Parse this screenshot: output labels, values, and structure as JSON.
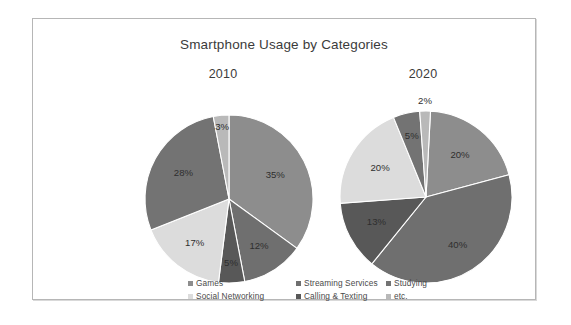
{
  "chart_data": {
    "type": "pie",
    "title": "Smartphone Usage by Categories",
    "legend_position": "bottom",
    "categories": [
      "Games",
      "Streaming Services",
      "Studying",
      "Social Networking",
      "Calling & Texting",
      "etc."
    ],
    "colors": [
      "#8d8d8d",
      "#6f6f6f",
      "#737373",
      "#dcdcdc",
      "#585858",
      "#b9b9b9"
    ],
    "panels": [
      {
        "label": "2010",
        "slices": [
          {
            "category": "Games",
            "value": 35,
            "label": "35%",
            "color": "#8d8d8d"
          },
          {
            "category": "Streaming Services",
            "value": 12,
            "label": "12%",
            "color": "#6f6f6f"
          },
          {
            "category": "Calling & Texting",
            "value": 5,
            "label": "5%",
            "color": "#585858"
          },
          {
            "category": "Social Networking",
            "value": 17,
            "label": "17%",
            "color": "#dcdcdc"
          },
          {
            "category": "Studying",
            "value": 28,
            "label": "28%",
            "color": "#737373"
          },
          {
            "category": "etc.",
            "value": 3,
            "label": "3%",
            "color": "#b9b9b9"
          }
        ]
      },
      {
        "label": "2020",
        "slices": [
          {
            "category": "Games",
            "value": 20,
            "label": "20%",
            "color": "#8d8d8d"
          },
          {
            "category": "Streaming Services",
            "value": 40,
            "label": "40%",
            "color": "#6f6f6f"
          },
          {
            "category": "Calling & Texting",
            "value": 13,
            "label": "13%",
            "color": "#585858"
          },
          {
            "category": "Social Networking",
            "value": 20,
            "label": "20%",
            "color": "#dcdcdc"
          },
          {
            "category": "Studying",
            "value": 5,
            "label": "5%",
            "color": "#737373"
          },
          {
            "category": "etc.",
            "value": 2,
            "label": "2%",
            "color": "#b9b9b9"
          }
        ]
      }
    ]
  },
  "legend": {
    "rows": [
      [
        {
          "label": "Games",
          "color": "#8d8d8d"
        },
        {
          "label": "Streaming Services",
          "color": "#6f6f6f"
        },
        {
          "label": "Studying",
          "color": "#737373"
        }
      ],
      [
        {
          "label": "Social Networking",
          "color": "#dcdcdc"
        },
        {
          "label": "Calling & Texting",
          "color": "#585858"
        },
        {
          "label": "etc.",
          "color": "#b9b9b9"
        }
      ]
    ]
  }
}
